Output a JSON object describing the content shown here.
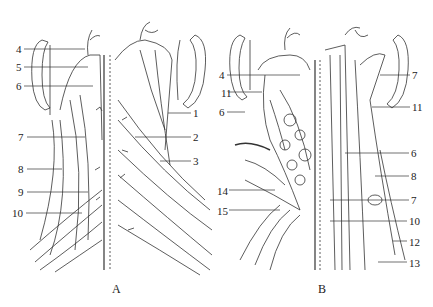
{
  "panels": [
    {
      "caption": "A",
      "caption_pos": [
        112,
        288
      ],
      "labels": [
        {
          "text": "4",
          "x": 16,
          "y": 44,
          "lx1": 24,
          "lx2": 85,
          "ly": 49
        },
        {
          "text": "5",
          "x": 16,
          "y": 62,
          "lx1": 24,
          "lx2": 88,
          "ly": 67
        },
        {
          "text": "6",
          "x": 16,
          "y": 81,
          "lx1": 24,
          "lx2": 93,
          "ly": 86
        },
        {
          "text": "1",
          "x": 193,
          "y": 108,
          "lx1": 168,
          "lx2": 191,
          "ly": 113
        },
        {
          "text": "7",
          "x": 18,
          "y": 132,
          "lx1": 27,
          "lx2": 85,
          "ly": 137
        },
        {
          "text": "2",
          "x": 193,
          "y": 132,
          "lx1": 135,
          "lx2": 191,
          "ly": 137
        },
        {
          "text": "3",
          "x": 193,
          "y": 156,
          "lx1": 160,
          "lx2": 191,
          "ly": 161
        },
        {
          "text": "8",
          "x": 18,
          "y": 164,
          "lx1": 27,
          "lx2": 62,
          "ly": 169
        },
        {
          "text": "9",
          "x": 18,
          "y": 187,
          "lx1": 27,
          "lx2": 88,
          "ly": 192
        },
        {
          "text": "10",
          "x": 12,
          "y": 208,
          "lx1": 26,
          "lx2": 82,
          "ly": 213
        }
      ]
    },
    {
      "caption": "B",
      "caption_pos": [
        322,
        288
      ],
      "labels": [
        {
          "text": "4",
          "x": 219,
          "y": 70,
          "lx1": 227,
          "lx2": 300,
          "ly": 75
        },
        {
          "text": "7",
          "x": 412,
          "y": 70,
          "lx1": 380,
          "lx2": 410,
          "ly": 75
        },
        {
          "text": "11",
          "x": 221,
          "y": 88,
          "lx1": 228,
          "lx2": 262,
          "ly": 92
        },
        {
          "text": "11",
          "x": 412,
          "y": 102,
          "lx1": 372,
          "lx2": 410,
          "ly": 107
        },
        {
          "text": "6",
          "x": 219,
          "y": 107,
          "lx1": 227,
          "lx2": 245,
          "ly": 112
        },
        {
          "text": "6",
          "x": 411,
          "y": 148,
          "lx1": 345,
          "lx2": 409,
          "ly": 153
        },
        {
          "text": "8",
          "x": 411,
          "y": 171,
          "lx1": 375,
          "lx2": 409,
          "ly": 176
        },
        {
          "text": "14",
          "x": 217,
          "y": 186,
          "lx1": 229,
          "lx2": 275,
          "ly": 190
        },
        {
          "text": "7",
          "x": 411,
          "y": 195,
          "lx1": 330,
          "lx2": 409,
          "ly": 200
        },
        {
          "text": "15",
          "x": 217,
          "y": 206,
          "lx1": 229,
          "lx2": 280,
          "ly": 210
        },
        {
          "text": "10",
          "x": 409,
          "y": 216,
          "lx1": 330,
          "lx2": 407,
          "ly": 221
        },
        {
          "text": "12",
          "x": 409,
          "y": 237,
          "lx1": 393,
          "lx2": 407,
          "ly": 241
        },
        {
          "text": "13",
          "x": 409,
          "y": 258,
          "lx1": 378,
          "lx2": 407,
          "ly": 262
        }
      ]
    }
  ]
}
